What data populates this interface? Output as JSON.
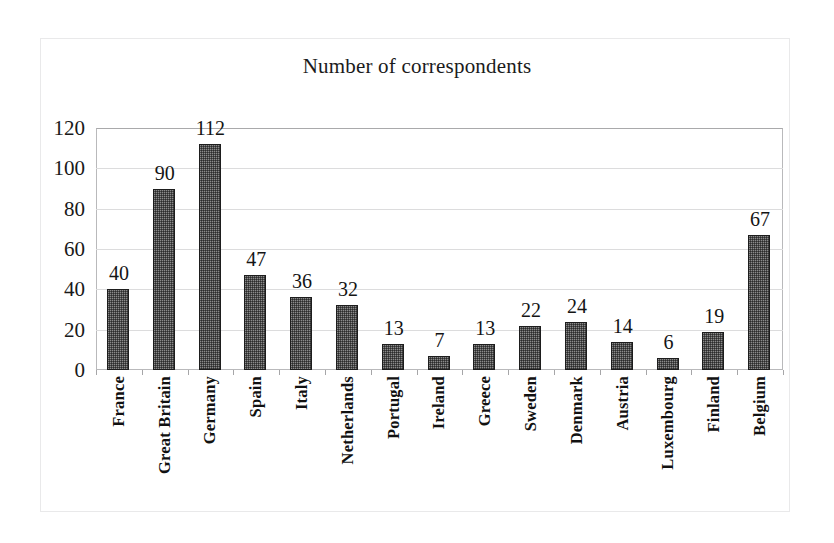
{
  "chart_data": {
    "type": "bar",
    "title": "Number of correspondents",
    "xlabel": "",
    "ylabel": "",
    "ylim": [
      0,
      120
    ],
    "yticks": [
      0,
      20,
      40,
      60,
      80,
      100,
      120
    ],
    "grid": true,
    "legend": null,
    "data_labels": true,
    "orientation": "vertical",
    "bar_color": "#8b8b8b",
    "bar_outline_color": "#1d1d1d",
    "categories": [
      "France",
      "Great Britain",
      "Germany",
      "Spain",
      "Italy",
      "Netherlands",
      "Portugal",
      "Ireland",
      "Greece",
      "Sweden",
      "Denmark",
      "Austria",
      "Luxembourg",
      "Finland",
      "Belgium"
    ],
    "values": [
      40,
      90,
      112,
      47,
      36,
      32,
      13,
      7,
      13,
      22,
      24,
      14,
      6,
      19,
      67
    ],
    "value_labels": [
      "40",
      "90",
      "112",
      "47",
      "36",
      "32",
      "13",
      "7",
      "13",
      "22",
      "24",
      "14",
      "6",
      "19",
      "67"
    ],
    "ytick_labels": [
      "0",
      "20",
      "40",
      "60",
      "80",
      "100",
      "120"
    ]
  }
}
